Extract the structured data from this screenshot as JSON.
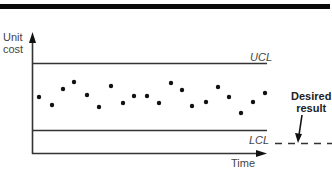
{
  "chart_data": {
    "type": "scatter",
    "title": "",
    "xlabel": "Time",
    "ylabel": "Unit cost",
    "grid": false,
    "control_limits": {
      "upper": {
        "label": "UCL",
        "y_px": 63
      },
      "lower": {
        "label": "LCL",
        "y_px": 130
      }
    },
    "annotation": {
      "text": "Desired result",
      "line": "dashed",
      "position": "below LCL, right of chart"
    },
    "points_px": [
      [
        39,
        97
      ],
      [
        52,
        105
      ],
      [
        63,
        89
      ],
      [
        74,
        82
      ],
      [
        87,
        95
      ],
      [
        99,
        107
      ],
      [
        111,
        86
      ],
      [
        123,
        103
      ],
      [
        134,
        96
      ],
      [
        147,
        96
      ],
      [
        159,
        103
      ],
      [
        171,
        83
      ],
      [
        182,
        90
      ],
      [
        192,
        106
      ],
      [
        206,
        102
      ],
      [
        218,
        87
      ],
      [
        229,
        97
      ],
      [
        241,
        113
      ],
      [
        253,
        102
      ],
      [
        265,
        93
      ]
    ]
  },
  "labels": {
    "ylabel_line1": "Unit",
    "ylabel_line2": "cost",
    "xlabel": "Time",
    "ucl": "UCL",
    "lcl": "LCL",
    "desired_line1": "Desired",
    "desired_line2": "result"
  },
  "colors": {
    "axis": "#333333",
    "points": "#111111",
    "bar": "#0a0a0a"
  }
}
